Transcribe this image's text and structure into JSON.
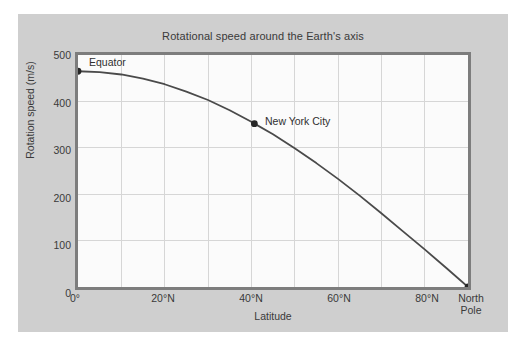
{
  "figure": {
    "background": "#ffffff",
    "panel_color": "#cfcfcf",
    "plot_background": "#fbfbfb",
    "axis_color": "#7d7d7d",
    "grid_color": "#d6d6d6",
    "line_color": "#4a4a4a",
    "marker_color": "#262626",
    "text_color": "#3a3a3a"
  },
  "chart_data": {
    "type": "line",
    "title": "Rotational speed around the Earth's axis",
    "xlabel": "Latitude",
    "ylabel": "Rotation speed (m/s)",
    "xlim": [
      0,
      90
    ],
    "ylim": [
      0,
      500
    ],
    "grid": true,
    "legend": "none",
    "x_tick_values": [
      0,
      20,
      40,
      60,
      80,
      90
    ],
    "x_tick_labels": [
      "0°",
      "20°N",
      "40°N",
      "60°N",
      "80°N",
      "North Pole"
    ],
    "x_gridline_values": [
      10,
      20,
      30,
      40,
      50,
      60,
      70,
      80
    ],
    "y_tick_values": [
      0,
      100,
      200,
      300,
      400,
      500
    ],
    "y_tick_labels": [
      "0",
      "100",
      "200",
      "300",
      "400",
      "500"
    ],
    "y_gridline_values": [
      100,
      200,
      300,
      400
    ],
    "series": [
      {
        "name": "Rotation speed",
        "x": [
          0,
          5,
          10,
          15,
          20,
          25,
          30,
          35,
          40,
          45,
          50,
          55,
          60,
          65,
          70,
          75,
          80,
          85,
          90
        ],
        "y": [
          465,
          463,
          458,
          449,
          437,
          421,
          403,
          381,
          356,
          329,
          299,
          267,
          233,
          197,
          159,
          120,
          81,
          41,
          0
        ]
      }
    ],
    "annotations": [
      {
        "label": "Equator",
        "x": 0,
        "y": 465,
        "marker": true
      },
      {
        "label": "New York City",
        "x": 40.7,
        "y": 352,
        "marker": true
      },
      {
        "label": "",
        "x": 90,
        "y": 0,
        "marker": true
      }
    ]
  }
}
